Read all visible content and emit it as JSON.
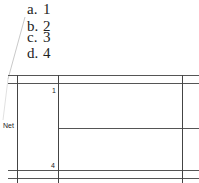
{
  "options": [
    {
      "letter": "a.",
      "value": "1"
    },
    {
      "letter": "b.",
      "value": "2"
    },
    {
      "letter": "c.",
      "value": "3"
    },
    {
      "letter": "d.",
      "value": "4"
    }
  ],
  "diagram": {
    "row_label": "Net",
    "top_number": "1",
    "bottom_number": "4"
  }
}
